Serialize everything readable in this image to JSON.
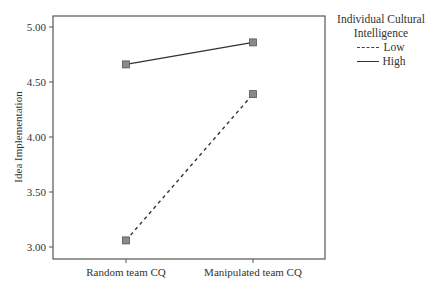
{
  "chart_data": {
    "type": "line",
    "title": "",
    "xlabel": "",
    "ylabel": "Idea Implementation",
    "categories": [
      "Random team CQ",
      "Manipulated team CQ"
    ],
    "series": [
      {
        "name": "Low",
        "style": "dashed",
        "values": [
          3.06,
          4.39
        ]
      },
      {
        "name": "High",
        "style": "solid",
        "values": [
          4.66,
          4.86
        ]
      }
    ],
    "ylim": [
      2.97,
      5.1
    ],
    "yticks": [
      3.0,
      3.5,
      4.0,
      4.5,
      5.0
    ],
    "ytick_labels": [
      "3.00",
      "3.50",
      "4.00",
      "4.50",
      "5.00"
    ],
    "grid": false,
    "legend": {
      "title": "Individual Cultural Intelligence",
      "title_lines": [
        "Individual Cultural",
        "Intelligence"
      ],
      "position": "right",
      "entries": [
        "Low",
        "High"
      ]
    },
    "marker": "square",
    "marker_color": "#8a8a8a",
    "line_color": "#333333"
  }
}
